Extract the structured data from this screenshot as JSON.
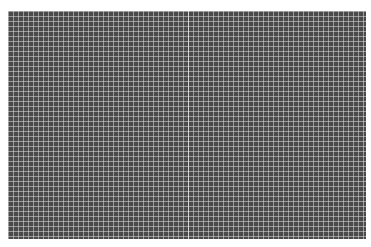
{
  "image": {
    "description": "Dark gray field covered by a dense light grid pattern",
    "grid": {
      "background": "#4a4a4a",
      "line_color": "#dcdcdc",
      "cell_size_px": 5
    }
  }
}
